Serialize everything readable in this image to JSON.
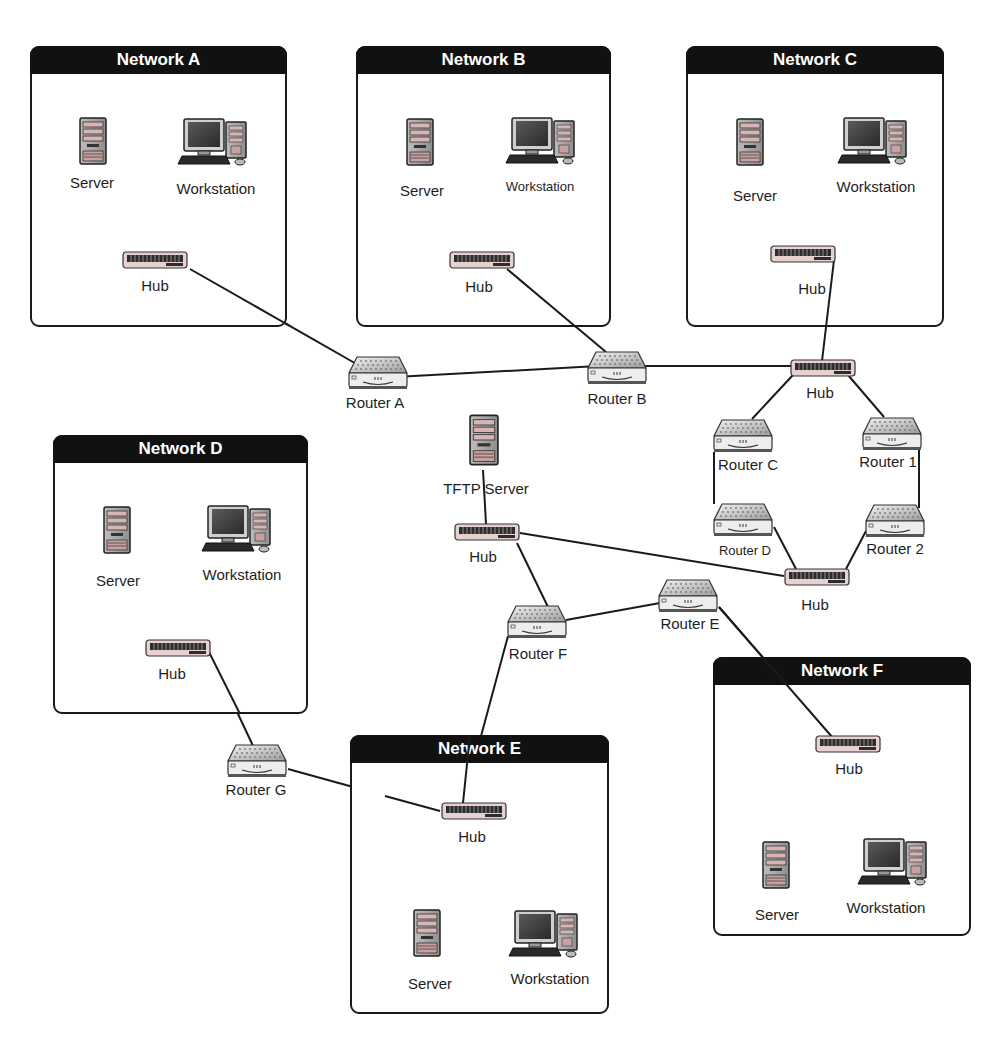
{
  "diagram": {
    "type": "network-topology",
    "networks": [
      {
        "id": "A",
        "title": "Network A",
        "devices": {
          "server": "Server",
          "workstation": "Workstation",
          "hub": "Hub"
        }
      },
      {
        "id": "B",
        "title": "Network B",
        "devices": {
          "server": "Server",
          "workstation": "Workstation",
          "hub": "Hub"
        }
      },
      {
        "id": "C",
        "title": "Network C",
        "devices": {
          "server": "Server",
          "workstation": "Workstation",
          "hub": "Hub"
        }
      },
      {
        "id": "D",
        "title": "Network D",
        "devices": {
          "server": "Server",
          "workstation": "Workstation",
          "hub": "Hub"
        }
      },
      {
        "id": "E",
        "title": "Network E",
        "devices": {
          "server": "Server",
          "workstation": "Workstation",
          "hub": "Hub"
        }
      },
      {
        "id": "F",
        "title": "Network F",
        "devices": {
          "server": "Server",
          "workstation": "Workstation",
          "hub": "Hub"
        }
      }
    ],
    "backbone": {
      "router_a": "Router A",
      "router_b": "Router B",
      "hub_upper": "Hub",
      "router_c": "Router C",
      "router_1": "Router 1",
      "router_d": "Router D",
      "router_2": "Router 2",
      "hub_lower": "Hub",
      "tftp_server": "TFTP Server",
      "hub_center": "Hub",
      "router_f": "Router F",
      "router_e": "Router E",
      "router_g": "Router G"
    },
    "links": [
      [
        "Network A Hub",
        "Router A"
      ],
      [
        "Router A",
        "Router B"
      ],
      [
        "Network B Hub",
        "Router B"
      ],
      [
        "Router B",
        "Hub (upper)"
      ],
      [
        "Network C Hub",
        "Hub (upper)"
      ],
      [
        "Hub (upper)",
        "Router C"
      ],
      [
        "Hub (upper)",
        "Router 1"
      ],
      [
        "Router C",
        "Router D"
      ],
      [
        "Router 1",
        "Router 2"
      ],
      [
        "Router D",
        "Hub (lower)"
      ],
      [
        "Router 2",
        "Hub (lower)"
      ],
      [
        "Hub (center)",
        "Hub (lower)"
      ],
      [
        "TFTP Server",
        "Hub (center)"
      ],
      [
        "Hub (center)",
        "Router F"
      ],
      [
        "Router F",
        "Router E"
      ],
      [
        "Router E",
        "Network F Hub"
      ],
      [
        "Router F",
        "Network E Hub"
      ],
      [
        "Network D Hub",
        "Router G"
      ],
      [
        "Router G",
        "Network E Hub"
      ]
    ]
  },
  "colors": {
    "header_bg": "#111111",
    "header_text": "#ffffff",
    "line": "#1a1a1a",
    "device_body": "#d6d6d6",
    "hub_face": "#c9a7a7"
  }
}
